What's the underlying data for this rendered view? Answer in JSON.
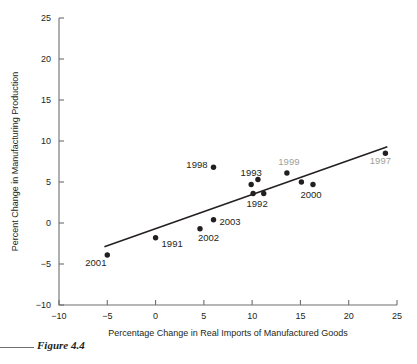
{
  "figure": {
    "caption": "Figure 4.4"
  },
  "chart_data": {
    "type": "scatter",
    "title": "",
    "xlabel": "Percentage Change in Real Imports of Manufactured Goods",
    "ylabel": "Percent Change in Manufacturing Production",
    "xlim": [
      -10,
      25
    ],
    "ylim": [
      -10,
      25
    ],
    "xticks": [
      -10,
      -5,
      0,
      5,
      10,
      15,
      20,
      25
    ],
    "xticklabels": [
      "−10",
      "−5",
      "0",
      "5",
      "10",
      "15",
      "20",
      "25"
    ],
    "yticks": [
      -10,
      -5,
      0,
      5,
      10,
      15,
      20,
      25
    ],
    "yticklabels": [
      "−10",
      "−5",
      "0",
      "5",
      "10",
      "15",
      "20",
      "25"
    ],
    "grid": false,
    "legend": false,
    "points": [
      {
        "label": "2001",
        "x": -5.0,
        "y": -3.9,
        "label_dx": -22,
        "label_dy": 11,
        "label_anchor": "start",
        "faint": false
      },
      {
        "label": "1991",
        "x": 0.0,
        "y": -1.8,
        "label_dx": 6,
        "label_dy": 9,
        "label_anchor": "start",
        "faint": false
      },
      {
        "label": "2002",
        "x": 4.6,
        "y": -0.7,
        "label_dx": -2,
        "label_dy": 12,
        "label_anchor": "start",
        "faint": false
      },
      {
        "label": "2003",
        "x": 6.0,
        "y": 0.4,
        "label_dx": 6,
        "label_dy": 5,
        "label_anchor": "start",
        "faint": false
      },
      {
        "label": "1998",
        "x": 6.0,
        "y": 6.8,
        "label_dx": -6,
        "label_dy": 1,
        "label_anchor": "end",
        "faint": false
      },
      {
        "label": "1993",
        "x": 9.9,
        "y": 4.7,
        "label_dx": 0,
        "label_dy": -8,
        "label_anchor": "middle",
        "faint": false
      },
      {
        "label": "1992",
        "x": 10.1,
        "y": 3.6,
        "label_dx": 4,
        "label_dy": 14,
        "label_anchor": "middle",
        "faint": false
      },
      {
        "label": "",
        "x": 10.6,
        "y": 5.3,
        "label_dx": 0,
        "label_dy": 0,
        "label_anchor": "middle",
        "faint": false
      },
      {
        "label": "",
        "x": 11.2,
        "y": 3.6,
        "label_dx": 0,
        "label_dy": 0,
        "label_anchor": "middle",
        "faint": false
      },
      {
        "label": "1999",
        "x": 13.6,
        "y": 6.1,
        "label_dx": 2,
        "label_dy": -8,
        "label_anchor": "middle",
        "faint": true
      },
      {
        "label": "",
        "x": 15.1,
        "y": 5.0,
        "label_dx": 0,
        "label_dy": 0,
        "label_anchor": "middle",
        "faint": false
      },
      {
        "label": "2000",
        "x": 16.3,
        "y": 4.7,
        "label_dx": -2,
        "label_dy": 14,
        "label_anchor": "middle",
        "faint": false
      },
      {
        "label": "1997",
        "x": 23.8,
        "y": 8.5,
        "label_dx": -5,
        "label_dy": 11,
        "label_anchor": "middle",
        "faint": true
      }
    ],
    "trendline": {
      "x0": -5.3,
      "y0": -2.9,
      "x1": 24.0,
      "y1": 9.3
    }
  }
}
